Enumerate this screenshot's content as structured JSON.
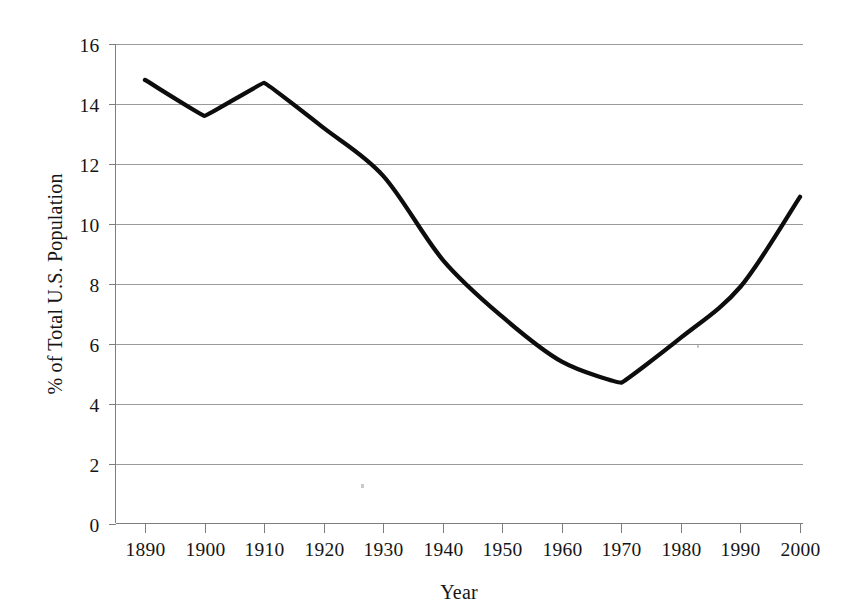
{
  "chart_data": {
    "type": "line",
    "title": "",
    "subtitle": "",
    "xlabel": "Year",
    "ylabel": "% of Total U.S. Population",
    "categories": [
      "1890",
      "1900",
      "1910",
      "1920",
      "1930",
      "1940",
      "1950",
      "1960",
      "1970",
      "1980",
      "1990",
      "2000"
    ],
    "x": [
      1890,
      1900,
      1910,
      1920,
      1930,
      1940,
      1950,
      1960,
      1970,
      1980,
      1990,
      2000
    ],
    "values": [
      14.8,
      13.6,
      14.7,
      13.2,
      11.6,
      8.8,
      6.9,
      5.4,
      4.7,
      6.2,
      7.9,
      10.9
    ],
    "series": [
      {
        "name": "% of Total U.S. Population",
        "values": [
          14.8,
          13.6,
          14.7,
          13.2,
          11.6,
          8.8,
          6.9,
          5.4,
          4.7,
          6.2,
          7.9,
          10.9
        ]
      }
    ],
    "xlim": [
      1890,
      2000
    ],
    "ylim": [
      0,
      16
    ],
    "ytick_labels": [
      "0",
      "2",
      "4",
      "6",
      "8",
      "10",
      "12",
      "14",
      "16"
    ],
    "ytick_values": [
      0,
      2,
      4,
      6,
      8,
      10,
      12,
      14,
      16
    ],
    "xtick_labels": [
      "1890",
      "1900",
      "1910",
      "1920",
      "1930",
      "1940",
      "1950",
      "1960",
      "1970",
      "1980",
      "1990",
      "2000"
    ],
    "grid": "horizontal",
    "legend": "none",
    "annotations": [],
    "line_color": "#0d0d0d",
    "grid_color": "#9a9a9a",
    "axis_color": "#7d7d7d",
    "background_color": "#ffffff"
  },
  "axes": {
    "y_title": "% of Total U.S. Population",
    "x_title": "Year",
    "y_ticks": [
      {
        "label": "16",
        "value": 16
      },
      {
        "label": "14",
        "value": 14
      },
      {
        "label": "12",
        "value": 12
      },
      {
        "label": "10",
        "value": 10
      },
      {
        "label": "8",
        "value": 8
      },
      {
        "label": "6",
        "value": 6
      },
      {
        "label": "4",
        "value": 4
      },
      {
        "label": "2",
        "value": 2
      },
      {
        "label": "0",
        "value": 0
      }
    ],
    "x_ticks": [
      {
        "label": "1890",
        "value": 1890
      },
      {
        "label": "1900",
        "value": 1900
      },
      {
        "label": "1910",
        "value": 1910
      },
      {
        "label": "1920",
        "value": 1920
      },
      {
        "label": "1930",
        "value": 1930
      },
      {
        "label": "1940",
        "value": 1940
      },
      {
        "label": "1950",
        "value": 1950
      },
      {
        "label": "1960",
        "value": 1960
      },
      {
        "label": "1970",
        "value": 1970
      },
      {
        "label": "1980",
        "value": 1980
      },
      {
        "label": "1990",
        "value": 1990
      },
      {
        "label": "2000",
        "value": 2000
      }
    ]
  }
}
